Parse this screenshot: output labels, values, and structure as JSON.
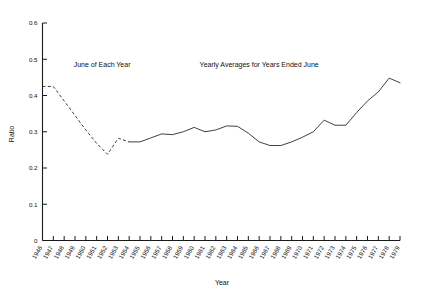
{
  "chart_data": {
    "type": "line",
    "title": "",
    "xlabel": "Year",
    "ylabel": "Ratio",
    "xlim": [
      1946,
      1979
    ],
    "ylim": [
      0,
      0.6
    ],
    "ytick_labels": [
      "0",
      "0.1",
      "0.2",
      "0.3",
      "0.4",
      "0.5",
      "0.6"
    ],
    "ytick_values": [
      0,
      0.1,
      0.2,
      0.3,
      0.4,
      0.5,
      0.6
    ],
    "grid": false,
    "legend_position": "none",
    "annotations": [
      {
        "text": "June of Each Year",
        "x": 1951.5,
        "y": 0.478
      },
      {
        "text": "Yearly Averages for Years Ended June",
        "x": 1966.0,
        "y": 0.478
      }
    ],
    "categories": [
      "1946",
      "1947",
      "1948",
      "1949",
      "1950",
      "1951",
      "1952",
      "1953",
      "1954",
      "1955",
      "1956",
      "1957",
      "1958",
      "1959",
      "1960",
      "1961",
      "1962",
      "1963",
      "1964",
      "1965",
      "1966",
      "1967",
      "1968",
      "1969",
      "1970",
      "1971",
      "1972",
      "1973",
      "1974",
      "1975",
      "1976",
      "1977",
      "1978",
      "1979"
    ],
    "series": [
      {
        "name": "June of Each Year",
        "style": "dashed",
        "x": [
          1946,
          1947,
          1948,
          1949,
          1950,
          1951,
          1952,
          1953,
          1954
        ],
        "values": [
          0.425,
          0.425,
          0.385,
          0.345,
          0.305,
          0.268,
          0.238,
          0.282,
          0.272
        ]
      },
      {
        "name": "Yearly Averages for Years Ended June",
        "style": "solid",
        "x": [
          1954,
          1955,
          1956,
          1957,
          1958,
          1959,
          1960,
          1961,
          1962,
          1963,
          1964,
          1965,
          1966,
          1967,
          1968,
          1969,
          1970,
          1971,
          1972,
          1973,
          1974,
          1975,
          1976,
          1977,
          1978,
          1979
        ],
        "values": [
          0.272,
          0.272,
          0.283,
          0.294,
          0.292,
          0.3,
          0.312,
          0.3,
          0.305,
          0.316,
          0.315,
          0.296,
          0.272,
          0.262,
          0.262,
          0.272,
          0.285,
          0.3,
          0.332,
          0.318,
          0.318,
          0.353,
          0.385,
          0.41,
          0.448,
          0.435
        ]
      }
    ]
  }
}
